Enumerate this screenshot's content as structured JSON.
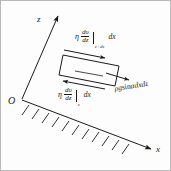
{
  "figure": {
    "background_color": "#fdfdfd",
    "line_color": "#1a1a1a",
    "border_color": "#b9b9b9",
    "width": 171,
    "height": 171
  },
  "axes": {
    "z_label": "z",
    "x_label": "x",
    "origin_label": "O"
  },
  "labels": {
    "top_stress": {
      "eta": "η",
      "numerator": "dυ",
      "denominator": "dz",
      "subscript": "z+dz",
      "tail": "dx",
      "plain": "η (dυ/dz)|z+dz dx"
    },
    "bottom_stress": {
      "eta": "η",
      "numerator": "dυ",
      "denominator": "dz",
      "subscript": "z",
      "tail": "dx",
      "plain": "η (dυ/dz)|z dx"
    },
    "gravity": {
      "rho": "ρ",
      "g": "g",
      "sin": "sin",
      "alpha": "α",
      "differentials": "dxdz",
      "plain": "ρg sin α dxdz"
    }
  },
  "element": {
    "name": "fluid-element-rectangle",
    "top_arrow_direction": "right",
    "bottom_arrow_direction": "left",
    "gravity_arrow_direction": "right-down"
  },
  "incline": {
    "name": "inclined-hatched-surface",
    "hatch_count": 11
  }
}
